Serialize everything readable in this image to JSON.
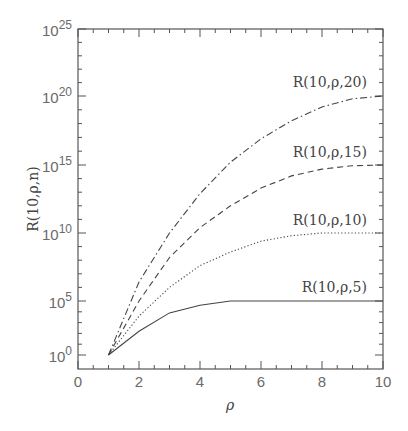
{
  "chart_data": {
    "type": "line",
    "title": "",
    "xlabel": "ρ",
    "ylabel": "R(10,ρ,n)",
    "xlim": [
      0,
      10
    ],
    "ylim_log10": [
      0,
      25
    ],
    "yscale": "log",
    "grid": false,
    "legend_position": "inline labels at right end of each curve",
    "x_ticks": [
      0,
      2,
      4,
      6,
      8,
      10
    ],
    "x_tick_labels": [
      "0",
      "2",
      "4",
      "6",
      "8",
      "10"
    ],
    "y_ticks_log10": [
      0,
      5,
      10,
      15,
      20,
      25
    ],
    "y_tick_labels": [
      {
        "base": "10",
        "exp": "0"
      },
      {
        "base": "10",
        "exp": "5"
      },
      {
        "base": "10",
        "exp": "10"
      },
      {
        "base": "10",
        "exp": "15"
      },
      {
        "base": "10",
        "exp": "20"
      },
      {
        "base": "10",
        "exp": "25"
      }
    ],
    "x": [
      1,
      2,
      3,
      4,
      5,
      6,
      7,
      8,
      9,
      10
    ],
    "series": [
      {
        "name": "R(10,ρ,5)",
        "style": "solid",
        "log10_values": [
          0,
          2.2,
          3.9,
          4.6,
          5.0,
          5.0,
          5.0,
          5.0,
          5.0,
          5.0
        ]
      },
      {
        "name": "R(10,ρ,10)",
        "style": "dotted",
        "log10_values": [
          0,
          3.6,
          6.0,
          7.6,
          8.6,
          9.4,
          9.8,
          10.0,
          10.0,
          10.0
        ]
      },
      {
        "name": "R(10,ρ,15)",
        "style": "dashed",
        "log10_values": [
          0,
          5.0,
          8.2,
          10.4,
          12.0,
          13.3,
          14.2,
          14.7,
          14.95,
          15.0
        ]
      },
      {
        "name": "R(10,ρ,20)",
        "style": "dashdot",
        "log10_values": [
          0,
          6.4,
          10.0,
          12.9,
          15.2,
          16.9,
          18.2,
          19.2,
          19.8,
          20.0
        ]
      }
    ]
  },
  "labels": {
    "xlabel": "ρ",
    "ylabel": "R(10,ρ,n)",
    "curves": [
      "R(10,ρ,20)",
      "R(10,ρ,15)",
      "R(10,ρ,10)",
      "R(10,ρ,5)"
    ]
  }
}
